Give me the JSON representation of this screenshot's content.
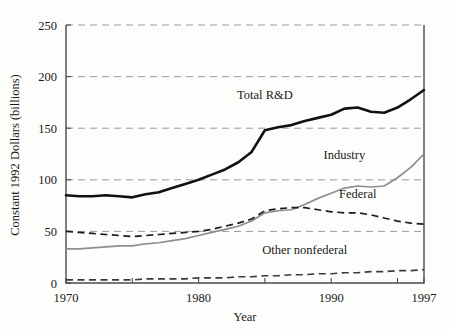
{
  "chart_data": {
    "type": "line",
    "title": "",
    "xlabel": "Year",
    "ylabel": "Constant 1992 Dollars (billions)",
    "xlim": [
      1970,
      1997
    ],
    "ylim": [
      0,
      250
    ],
    "grid": true,
    "grid_axis": "y",
    "legend_position": "inline-labels",
    "x_ticks": [
      1970,
      1975,
      1980,
      1985,
      1990,
      1995,
      1997
    ],
    "x_tick_labels": [
      "1970",
      "",
      "1980",
      "",
      "1990",
      "",
      "1997"
    ],
    "y_ticks": [
      0,
      50,
      100,
      150,
      200,
      250
    ],
    "y_tick_labels": [
      "0",
      "50",
      "100",
      "150",
      "200",
      "250"
    ],
    "x": [
      1970,
      1971,
      1972,
      1973,
      1974,
      1975,
      1976,
      1977,
      1978,
      1979,
      1980,
      1981,
      1982,
      1983,
      1984,
      1985,
      1986,
      1987,
      1988,
      1989,
      1990,
      1991,
      1992,
      1993,
      1994,
      1995,
      1996,
      1997
    ],
    "series": [
      {
        "name": "Total R&D",
        "style": "solid-thick",
        "color": "#111111",
        "label_x": 1985,
        "label_y": 178,
        "values": [
          85,
          84,
          84,
          85,
          84,
          83,
          86,
          88,
          92,
          96,
          100,
          105,
          110,
          117,
          127,
          148,
          151,
          153,
          157,
          160,
          163,
          169,
          170,
          166,
          165,
          170,
          178,
          187
        ]
      },
      {
        "name": "Industry",
        "style": "solid-thin",
        "color": "#8e8e8e",
        "label_x": 1991,
        "label_y": 120,
        "values": [
          33,
          33,
          34,
          35,
          36,
          36,
          38,
          39,
          41,
          43,
          46,
          49,
          52,
          55,
          60,
          68,
          70,
          71,
          76,
          82,
          87,
          92,
          94,
          93,
          94,
          102,
          112,
          125
        ]
      },
      {
        "name": "Federal",
        "style": "dashed",
        "color": "#1d1d1d",
        "label_x": 1992,
        "label_y": 82,
        "values": [
          50,
          49,
          48,
          47,
          46,
          45,
          46,
          47,
          48,
          49,
          50,
          52,
          55,
          58,
          62,
          70,
          72,
          73,
          73,
          71,
          69,
          68,
          68,
          66,
          63,
          60,
          58,
          57
        ]
      },
      {
        "name": "Other nonfederal",
        "style": "dashed",
        "color": "#3a3a3a",
        "label_x": 1988,
        "label_y": 28,
        "values": [
          3,
          3,
          3,
          3,
          3,
          3,
          4,
          4,
          4,
          4,
          5,
          5,
          5,
          6,
          6,
          7,
          7,
          8,
          8,
          9,
          9,
          10,
          10,
          11,
          11,
          12,
          12,
          13
        ]
      }
    ]
  }
}
